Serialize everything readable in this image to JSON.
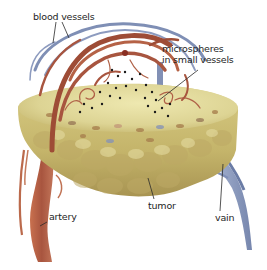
{
  "labels": {
    "blood_vessels": "blood vessels",
    "microspheres_line1": "microspheres",
    "microspheres_line2": "in small vessels",
    "tumor": "tumor",
    "artery": "artery",
    "vein": "vain"
  },
  "colors": {
    "background": "#ffffff",
    "tumor_light": "#e3dc9a",
    "tumor_mid": "#cfc27a",
    "tumor_dark": "#b8a45e",
    "artery": "#a8553f",
    "artery_light": "#cc7a5a",
    "vein": "#7f8fb5",
    "vein_light": "#a7b3d0",
    "microsphere": "#1a1a1a",
    "leader_line": "#2a2a2a"
  }
}
